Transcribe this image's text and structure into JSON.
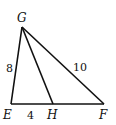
{
  "diagram": {
    "type": "triangle",
    "points": {
      "G": {
        "label": "G",
        "x": 22,
        "y": 27
      },
      "E": {
        "label": "E",
        "x": 11,
        "y": 104
      },
      "H": {
        "label": "H",
        "x": 53,
        "y": 104
      },
      "F": {
        "label": "F",
        "x": 104,
        "y": 104
      }
    },
    "segments": [
      {
        "from": "G",
        "to": "E",
        "length_label": "8"
      },
      {
        "from": "E",
        "to": "H",
        "length_label": "4"
      },
      {
        "from": "G",
        "to": "F",
        "length_label": "10"
      },
      {
        "from": "G",
        "to": "H",
        "length_label": ""
      },
      {
        "from": "H",
        "to": "F",
        "length_label": ""
      }
    ],
    "labels": {
      "G": "G",
      "E": "E",
      "H": "H",
      "F": "F",
      "GE": "8",
      "EH": "4",
      "GF": "10"
    },
    "stroke_color": "#111111"
  }
}
